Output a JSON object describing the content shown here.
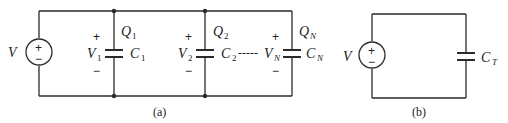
{
  "figure": {
    "panel_a": {
      "caption": "(a)",
      "source": {
        "label": "V",
        "plus": "+",
        "minus": "−"
      },
      "capacitors": [
        {
          "name": "C",
          "sub": "1",
          "voltage": "V",
          "voltage_sub": "1",
          "charge": "Q",
          "charge_sub": "1",
          "plus": "+",
          "minus": "−"
        },
        {
          "name": "C",
          "sub": "2",
          "voltage": "V",
          "voltage_sub": "2",
          "charge": "Q",
          "charge_sub": "2",
          "plus": "+",
          "minus": "−"
        },
        {
          "name": "C",
          "sub": "N",
          "voltage": "V",
          "voltage_sub": "N",
          "charge": "Q",
          "charge_sub": "N",
          "plus": "+",
          "minus": "−"
        }
      ],
      "ellipsis": "-----"
    },
    "panel_b": {
      "caption": "(b)",
      "source": {
        "label": "V",
        "plus": "+",
        "minus": "−"
      },
      "capacitor": {
        "name": "C",
        "sub": "T"
      }
    }
  }
}
